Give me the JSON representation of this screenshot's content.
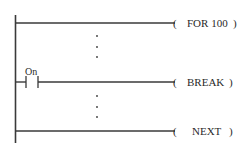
{
  "diagram": {
    "type": "ladder-logic",
    "rungs": [
      {
        "id": "for",
        "y": 23,
        "contact": null,
        "coil": {
          "open": "(",
          "label": "FOR 100",
          "close": ")"
        }
      },
      {
        "id": "break",
        "y": 82,
        "contact": {
          "label": "On",
          "type": "normally-open"
        },
        "coil": {
          "open": "(",
          "label": "BREAK",
          "close": ")"
        }
      },
      {
        "id": "next",
        "y": 131,
        "contact": null,
        "coil": {
          "open": "(",
          "label": "NEXT",
          "close": ")"
        }
      }
    ],
    "ellipsis_groups": [
      {
        "after_rung": "for",
        "dots": 3
      },
      {
        "after_rung": "break",
        "dots": 3
      }
    ],
    "colors": {
      "line": "#3a3a3a",
      "text": "#2a2a2a",
      "background": "#ffffff"
    }
  }
}
